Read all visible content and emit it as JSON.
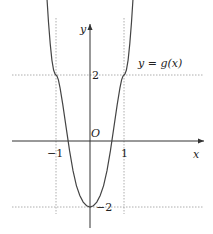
{
  "chart_data": {
    "type": "line",
    "title": "",
    "xlabel": "x",
    "ylabel": "y",
    "origin_label": "O",
    "curve_label": "y = g(x)",
    "x_ticks": [
      {
        "value": -1,
        "label": "−1"
      },
      {
        "value": 1,
        "label": "1"
      }
    ],
    "y_ticks": [
      {
        "value": 2,
        "label": "2"
      },
      {
        "value": -2,
        "label": "−2"
      }
    ],
    "guides": {
      "vertical": [
        -1,
        1
      ],
      "horizontal": [
        2,
        -2
      ]
    },
    "xlim": [
      -2.5,
      3.5
    ],
    "ylim": [
      -2.6,
      4.4
    ],
    "series": [
      {
        "name": "g(x)",
        "x": [
          -1.27,
          -1.22,
          -1.17,
          -1.12,
          -1.07,
          -1.03,
          -1.0,
          -0.97,
          -0.93,
          -0.88,
          -0.8,
          -0.7,
          -0.6,
          -0.5,
          -0.4,
          -0.3,
          -0.2,
          -0.1,
          0.0,
          0.1,
          0.2,
          0.3,
          0.4,
          0.5,
          0.6,
          0.7,
          0.8,
          0.88,
          0.93,
          0.97,
          1.0,
          1.03,
          1.07,
          1.12,
          1.17,
          1.22,
          1.27
        ],
        "y": [
          4.4,
          3.6,
          2.95,
          2.45,
          2.15,
          2.03,
          2.0,
          1.97,
          1.85,
          1.6,
          1.1,
          0.4,
          -0.3,
          -0.9,
          -1.35,
          -1.65,
          -1.85,
          -1.96,
          -2.0,
          -1.96,
          -1.85,
          -1.65,
          -1.35,
          -0.9,
          -0.3,
          0.4,
          1.1,
          1.6,
          1.85,
          1.97,
          2.0,
          2.03,
          2.15,
          2.45,
          2.95,
          3.6,
          4.4
        ]
      }
    ]
  }
}
